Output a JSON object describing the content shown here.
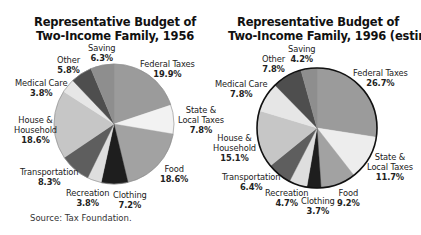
{
  "chart_data": [
    {
      "type": "pie",
      "title": "Representative Budget of Two-Income Family, 1956",
      "title_lines": [
        "Representative Budget of",
        "Two-Income Family, 1956"
      ],
      "categories": [
        "Federal Taxes",
        "State & Local Taxes",
        "Food",
        "Clothing",
        "Recreation",
        "Transportation",
        "House & Household",
        "Medical Care",
        "Other",
        "Saving"
      ],
      "values": [
        19.9,
        7.8,
        18.6,
        7.2,
        3.8,
        8.3,
        18.6,
        3.8,
        5.8,
        6.3
      ],
      "value_labels": [
        "19.9%",
        "7.8%",
        "18.6%",
        "7.2%",
        "3.8%",
        "8.3%",
        "18.6%",
        "3.8%",
        "5.8%",
        "6.3%"
      ],
      "colors": [
        "#9b9b9b",
        "#f2f2f2",
        "#a2a2a2",
        "#1e1e1e",
        "#dedede",
        "#5e5e5e",
        "#c6c6c6",
        "#e6e6e6",
        "#4e4e4e",
        "#8e8e8e"
      ],
      "start_angle_deg": 0,
      "direction": "clockwise",
      "outline": false
    },
    {
      "type": "pie",
      "title": "Representative Budget of Two-Income Family, 1996 (estimated)",
      "title_lines": [
        "Representative Budget of",
        "Two-Income Family, 1996 (estimated)"
      ],
      "categories": [
        "Federal Taxes",
        "State & Local Taxes",
        "Food",
        "Clothing",
        "Recreation",
        "Transportation",
        "House & Household",
        "Medical Care",
        "Other",
        "Saving"
      ],
      "values": [
        26.7,
        11.7,
        9.2,
        3.7,
        4.7,
        6.4,
        15.1,
        7.8,
        7.8,
        4.2
      ],
      "value_labels": [
        "26.7%",
        "11.7%",
        "9.2%",
        "3.7%",
        "4.7%",
        "6.4%",
        "15.1%",
        "7.8%",
        "7.8%",
        "4.2%"
      ],
      "colors": [
        "#9b9b9b",
        "#ededed",
        "#a2a2a2",
        "#1e1e1e",
        "#dedede",
        "#5e5e5e",
        "#c6c6c6",
        "#e6e6e6",
        "#4e4e4e",
        "#8e8e8e"
      ],
      "start_angle_deg": 0,
      "direction": "clockwise",
      "outline": true
    }
  ],
  "charts": {
    "left": {
      "title_line1": "Representative Budget of",
      "title_line2": "Two-Income Family, 1956",
      "labels": {
        "saving": {
          "name": "Saving",
          "value": "6.3%"
        },
        "other": {
          "name": "Other",
          "value": "5.8%"
        },
        "federal": {
          "name": "Federal Taxes",
          "value": "19.9%"
        },
        "medical": {
          "name": "Medical Care",
          "value": "3.8%"
        },
        "state_1": "State &",
        "state_2": "Local Taxes",
        "state_v": "7.8%",
        "house_1": "House &",
        "house_2": "Household",
        "house_v": "18.6%",
        "transport": {
          "name": "Transportation",
          "value": "8.3%"
        },
        "food": {
          "name": "Food",
          "value": "18.6%"
        },
        "recreation": {
          "name": "Recreation",
          "value": "3.8%"
        },
        "clothing": {
          "name": "Clothing",
          "value": "7.2%"
        }
      }
    },
    "right": {
      "title_line1": "Representative Budget of",
      "title_line2": "Two-Income Family, 1996 (estimated)",
      "labels": {
        "saving": {
          "name": "Saving",
          "value": "4.2%"
        },
        "other": {
          "name": "Other",
          "value": "7.8%"
        },
        "federal": {
          "name": "Federal Taxes",
          "value": "26.7%"
        },
        "medical": {
          "name": "Medical Care",
          "value": "7.8%"
        },
        "state_1": "State &",
        "state_2": "Local Taxes",
        "state_v": "11.7%",
        "house_1": "House &",
        "house_2": "Household",
        "house_v": "15.1%",
        "transport": {
          "name": "Transportation",
          "value": "6.4%"
        },
        "food": {
          "name": "Food",
          "value": "9.2%"
        },
        "recreation": {
          "name": "Recreation",
          "value": "4.7%"
        },
        "clothing": {
          "name": "Clothing",
          "value": "3.7%"
        }
      }
    }
  },
  "source": "Source: Tax Foundation."
}
